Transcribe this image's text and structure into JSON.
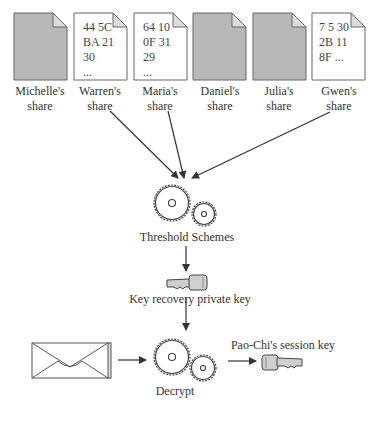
{
  "shares": [
    {
      "owner": "Michelle's",
      "sub": "share",
      "revealed": false,
      "content": ""
    },
    {
      "owner": "Warren's",
      "sub": "share",
      "revealed": true,
      "content": "44 5C\nBA 21\n30\n..."
    },
    {
      "owner": "Maria's",
      "sub": "share",
      "revealed": true,
      "content": "64 10\n0F 31\n29\n..."
    },
    {
      "owner": "Daniel's",
      "sub": "share",
      "revealed": false,
      "content": ""
    },
    {
      "owner": "Julia's",
      "sub": "share",
      "revealed": false,
      "content": ""
    },
    {
      "owner": "Gwen's",
      "sub": "share",
      "revealed": true,
      "content": "7 5 30\n2B 11\n8F ..."
    }
  ],
  "nodes": {
    "threshold": {
      "label": "Threshold Schemes",
      "icon": "gears-icon"
    },
    "recovery_key": {
      "label": "Key recovery private key",
      "icon": "key-icon"
    },
    "decrypt": {
      "label": "Decrypt",
      "icon": "gears-icon"
    },
    "message": {
      "icon": "envelope-icon"
    },
    "session_key": {
      "label": "Pao-Chi's session key",
      "icon": "key-icon"
    }
  },
  "colors": {
    "hidden_share_fill": "#b8b8b8",
    "revealed_share_fill": "#ffffff",
    "stroke": "#555555",
    "key_fill": "#cfcfcf"
  }
}
